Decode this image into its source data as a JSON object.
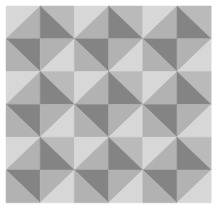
{
  "pattern": {
    "name": "diagonal-triangle-tiling",
    "grid": {
      "cols": 6,
      "rows": 6,
      "x0": 6,
      "y0": 6,
      "cell_w": 34.2,
      "cell_h": 32.8
    },
    "background": "#ffffff",
    "colors": {
      "light": "#d7d7d7",
      "medium_light": "#bababa",
      "medium": "#b2b2b2",
      "dark": "#848484"
    },
    "tile": [
      [
        {
          "diagonal": "/",
          "first": "light",
          "second": "medium"
        },
        {
          "diagonal": "\\",
          "first": "medium_light",
          "second": "dark"
        }
      ],
      [
        {
          "diagonal": "\\",
          "first": "dark",
          "second": "medium"
        },
        {
          "diagonal": "/",
          "first": "medium",
          "second": "light"
        }
      ]
    ]
  }
}
